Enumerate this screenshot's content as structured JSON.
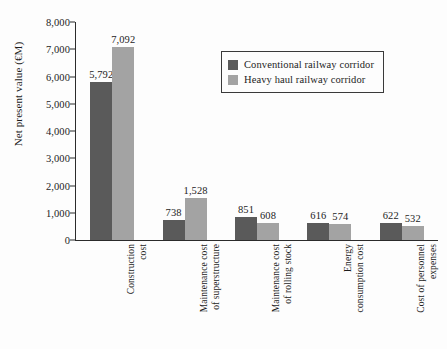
{
  "chart_data": {
    "type": "bar",
    "title": "",
    "xlabel": "",
    "ylabel": "Net present value (€M)",
    "ylim": [
      0,
      8000
    ],
    "ytick_step": 1000,
    "ytick_labels": [
      "0",
      "1,000",
      "2,000",
      "3,000",
      "4,000",
      "5,000",
      "6,000",
      "7,000",
      "8,000"
    ],
    "grid": false,
    "legend_position": "upper-center-right",
    "categories": [
      "Construction cost",
      "Maintenance cost of superstructure",
      "Maintenance cost of rolling stock",
      "Energy consumption cost",
      "Cost of personnel expenses"
    ],
    "category_label_lines": [
      [
        "Construction",
        "cost"
      ],
      [
        "Maintenance cost",
        "of superstructure"
      ],
      [
        "Maintenance cost",
        "of rolling stock"
      ],
      [
        "Energy",
        "consumption cost"
      ],
      [
        "Cost of personnel",
        "expenses"
      ]
    ],
    "series": [
      {
        "name": "Conventional railway corridor",
        "color": "#5a5a5a",
        "values": [
          5792,
          738,
          851,
          616,
          622
        ],
        "value_labels": [
          "5,792",
          "738",
          "851",
          "616",
          "622"
        ]
      },
      {
        "name": "Heavy haul railway corridor",
        "color": "#a3a3a3",
        "values": [
          7092,
          1528,
          608,
          574,
          532
        ],
        "value_labels": [
          "7,092",
          "1,528",
          "608",
          "574",
          "532"
        ]
      }
    ]
  }
}
